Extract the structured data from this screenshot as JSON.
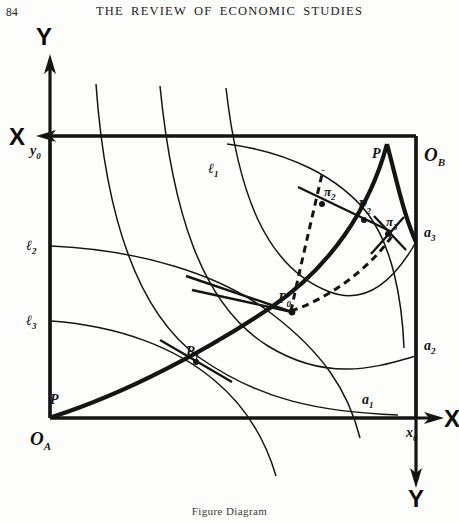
{
  "header": {
    "folio": "84",
    "title": "THE REVIEW OF ECONOMIC STUDIES"
  },
  "caption": {
    "text": "Figure Diagram"
  },
  "figure": {
    "axis_labels": {
      "y_top": "Y",
      "y_bottom": "Y",
      "x_left": "X",
      "x_right": "X"
    },
    "origin_labels": {
      "lower_left": "O",
      "lower_left_sub": "A",
      "upper_right": "O",
      "upper_right_sub": "B"
    },
    "tick_labels": {
      "y_origin": "y",
      "y_origin_sub": "0",
      "x_origin": "x",
      "x_origin_sub": "0"
    },
    "curve_labels": [
      {
        "name": "l1",
        "base": "ℓ",
        "sub": "1",
        "x": 208,
        "y": 155
      },
      {
        "name": "l2",
        "base": "ℓ",
        "sub": "2",
        "x": 30,
        "y": 228
      },
      {
        "name": "l3",
        "base": "ℓ",
        "sub": "3",
        "x": 30,
        "y": 303
      },
      {
        "name": "a1",
        "base": "a",
        "sub": "1",
        "x": 366,
        "y": 395
      },
      {
        "name": "a2",
        "base": "a",
        "sub": "2",
        "x": 424,
        "y": 347
      },
      {
        "name": "a3",
        "base": "a",
        "sub": "3",
        "x": 424,
        "y": 234
      }
    ],
    "point_labels": [
      {
        "name": "P",
        "base": "P",
        "sub": "",
        "x": 54,
        "y": 386
      },
      {
        "name": "P1",
        "base": "P",
        "sub": "1",
        "x": 190,
        "y": 338
      },
      {
        "name": "P0",
        "base": "P",
        "sub": "0",
        "x": 285,
        "y": 282
      },
      {
        "name": "P2",
        "base": "P",
        "sub": "2",
        "x": 363,
        "y": 192
      },
      {
        "name": "P-top",
        "base": "P",
        "sub": "",
        "x": 377,
        "y": 152
      },
      {
        "name": "pi2",
        "base": "π",
        "sub": "2",
        "x": 327,
        "y": 180
      },
      {
        "name": "pi3",
        "base": "π",
        "sub": "3",
        "x": 392,
        "y": 215
      }
    ],
    "colors": {
      "ink": "#141414",
      "paper": "#fdfdfc"
    }
  }
}
